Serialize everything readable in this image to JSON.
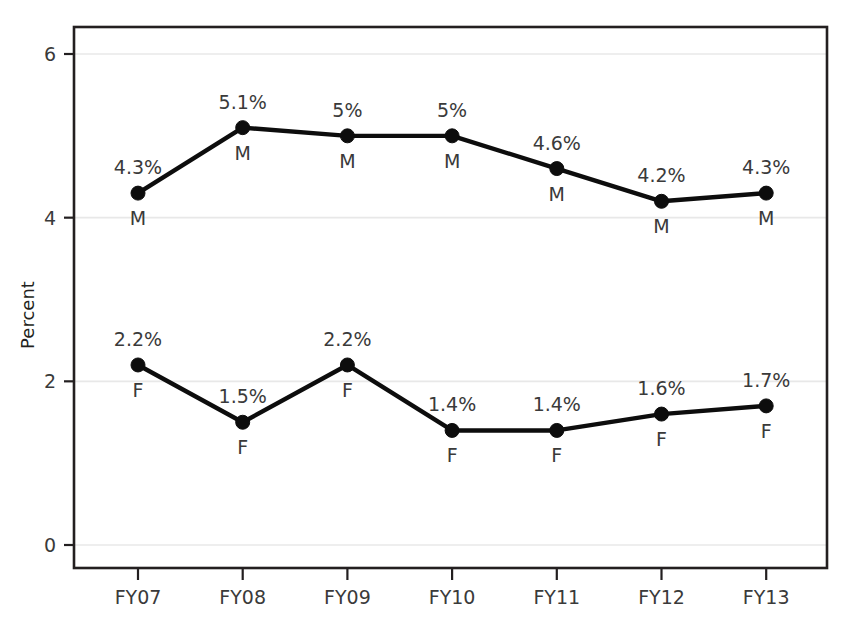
{
  "chart_data": {
    "type": "line",
    "title": "",
    "xlabel": "",
    "ylabel": "Percent",
    "categories": [
      "FY07",
      "FY08",
      "FY09",
      "FY10",
      "FY11",
      "FY12",
      "FY13"
    ],
    "ylim": [
      0,
      6.4
    ],
    "yticks": [
      0,
      2,
      4,
      6
    ],
    "ytick_labels": [
      "0",
      "2",
      "4",
      "6"
    ],
    "grid": true,
    "legend_position": "none",
    "series": [
      {
        "name": "M",
        "code": "M",
        "code_labels": [
          "M",
          "M",
          "M",
          "M",
          "M",
          "M",
          "M"
        ],
        "values": [
          4.3,
          5.1,
          5,
          5,
          4.6,
          4.2,
          4.3
        ],
        "value_labels": [
          "4.3%",
          "5.1%",
          "5%",
          "5%",
          "4.6%",
          "4.2%",
          "4.3%"
        ]
      },
      {
        "name": "F",
        "code": "F",
        "code_labels": [
          "F",
          "F",
          "F",
          "F",
          "F",
          "F",
          "F"
        ],
        "values": [
          2.2,
          1.5,
          2.2,
          1.4,
          1.4,
          1.6,
          1.7
        ],
        "value_labels": [
          "2.2%",
          "1.5%",
          "2.2%",
          "1.4%",
          "1.4%",
          "1.6%",
          "1.7%"
        ]
      }
    ],
    "colors": {
      "line": "#0d0d0d",
      "marker": "#0d0d0d",
      "grid": "#e8e8e8",
      "axis": "#231f20",
      "text": "#3a3a3a",
      "background": "#ffffff"
    }
  }
}
